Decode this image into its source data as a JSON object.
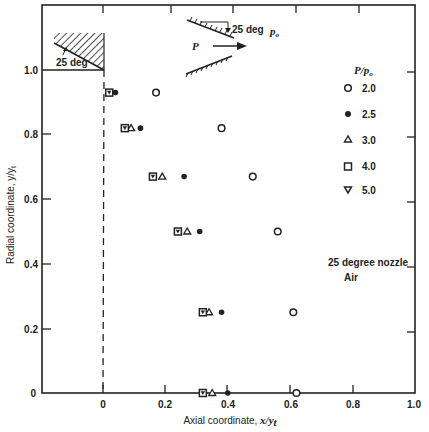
{
  "chart_data": {
    "type": "scatter",
    "title": "",
    "xlabel": "Axial coordinate, x/y_t",
    "ylabel": "Radial coordinate, y/y_t",
    "xlim": [
      -0.2,
      1.0
    ],
    "ylim": [
      0,
      1.2
    ],
    "xticks": [
      "0",
      "0.2",
      "0.4",
      "0.6",
      "0.8",
      "1.0"
    ],
    "yticks": [
      "0",
      "0.2",
      "0.4",
      "0.6",
      "0.8",
      "1.0"
    ],
    "grid": false,
    "legend_title": "P/p_o",
    "legend_position": "right",
    "series": [
      {
        "name": "2.0",
        "marker": "open-circle",
        "points": [
          [
            0.17,
            0.93
          ],
          [
            0.38,
            0.82
          ],
          [
            0.48,
            0.67
          ],
          [
            0.56,
            0.5
          ],
          [
            0.61,
            0.25
          ],
          [
            0.62,
            0.0
          ]
        ]
      },
      {
        "name": "2.5",
        "marker": "filled-circle",
        "points": [
          [
            0.04,
            0.93
          ],
          [
            0.12,
            0.82
          ],
          [
            0.26,
            0.67
          ],
          [
            0.31,
            0.5
          ],
          [
            0.38,
            0.25
          ],
          [
            0.4,
            0.0
          ]
        ]
      },
      {
        "name": "3.0",
        "marker": "open-triangle",
        "points": [
          [
            0.09,
            0.82
          ],
          [
            0.19,
            0.67
          ],
          [
            0.27,
            0.5
          ],
          [
            0.34,
            0.25
          ],
          [
            0.35,
            0.0
          ]
        ]
      },
      {
        "name": "4.0",
        "marker": "open-square",
        "points": [
          [
            0.02,
            0.93
          ],
          [
            0.07,
            0.82
          ],
          [
            0.16,
            0.67
          ],
          [
            0.24,
            0.5
          ],
          [
            0.32,
            0.25
          ],
          [
            0.32,
            0.0
          ]
        ]
      },
      {
        "name": "5.0",
        "marker": "inverted-triangle",
        "points": [
          [
            0.02,
            0.93
          ],
          [
            0.07,
            0.82
          ],
          [
            0.16,
            0.67
          ],
          [
            0.24,
            0.5
          ],
          [
            0.32,
            0.25
          ],
          [
            0.32,
            0.0
          ]
        ]
      }
    ],
    "annotations": [
      "25 deg (wall angle, top-left inset)",
      "25 deg (nozzle schematic)",
      "P",
      "p_o",
      "25 degree nozzle",
      "Air",
      "dashed vertical line at x = 0 (throat)"
    ]
  },
  "labels": {
    "xlabel_main": "Axial coordinate, ",
    "xlabel_var": "x/y",
    "xlabel_sub": "t",
    "ylabel": "Radial coordinate, y/y",
    "ylabel_sub": "t",
    "legend_title_main": "P/p",
    "legend_title_sub": "o",
    "legend_items": [
      "2.0",
      "2.5",
      "3.0",
      "4.0",
      "5.0"
    ],
    "inset_angle": "25 deg",
    "schematic_angle": "25 deg",
    "schematic_P": "P",
    "schematic_po": "p",
    "schematic_po_sub": "o",
    "note_line1": "25 degree nozzle",
    "note_line2": "Air",
    "x_tick_0": "0",
    "x_tick_1": "0.2",
    "x_tick_2": "0.4",
    "x_tick_3": "0.6",
    "x_tick_4": "0.8",
    "x_tick_5": "1.0",
    "y_tick_0": "0",
    "y_tick_1": "0.2",
    "y_tick_2": "0.4",
    "y_tick_3": "0.6",
    "y_tick_4": "0.8",
    "y_tick_5": "1.0"
  }
}
